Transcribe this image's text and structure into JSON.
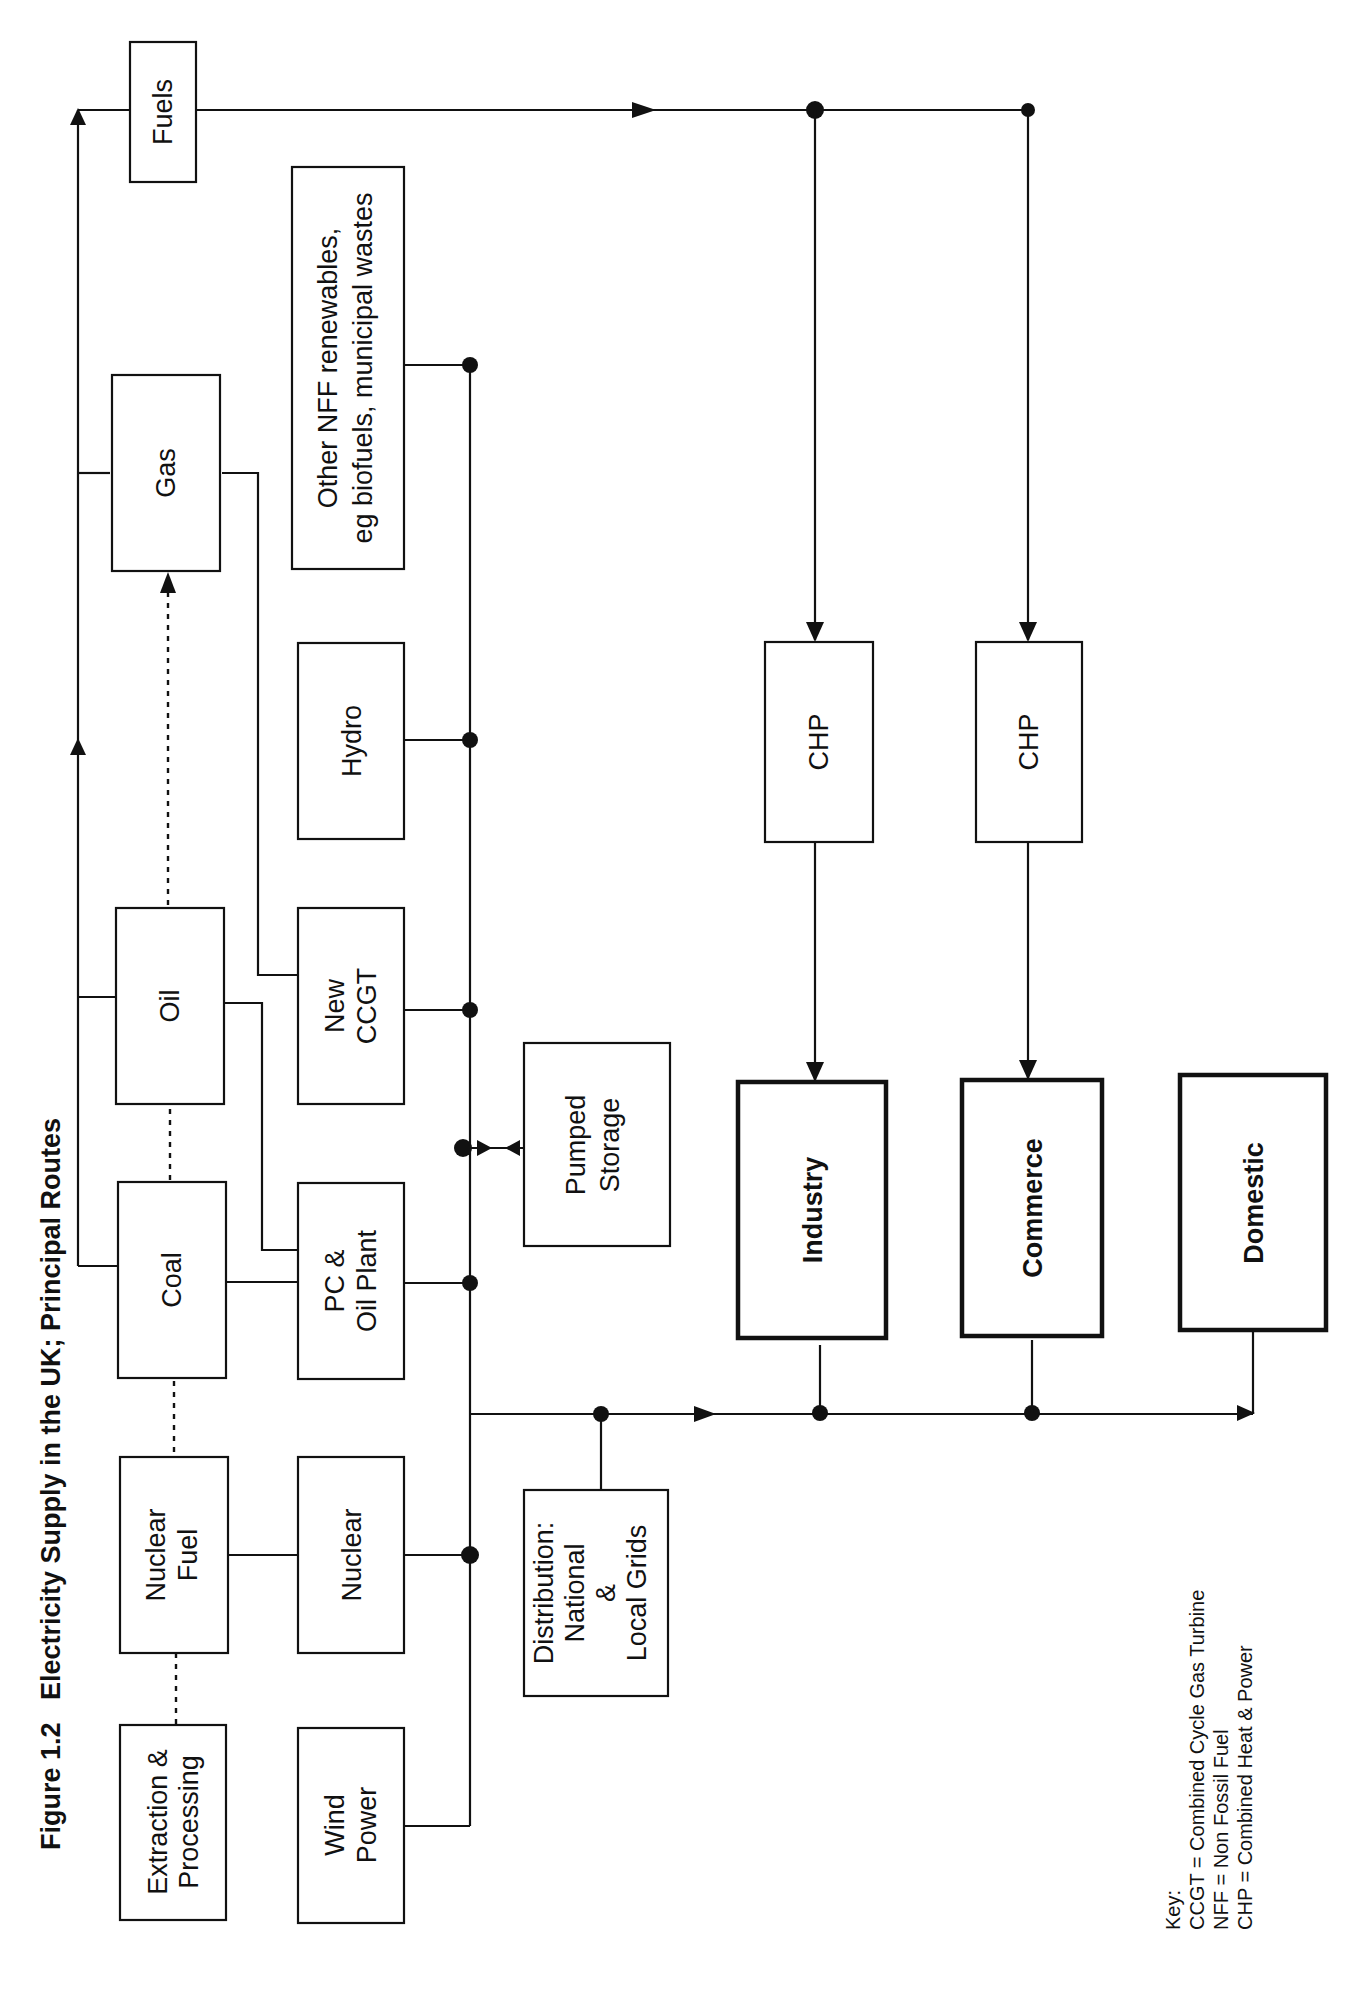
{
  "figure": {
    "number": "Figure 1.2",
    "title": "Electricity Supply in the UK; Principal Routes"
  },
  "nodes": {
    "extraction": [
      "Extraction &",
      "Processing"
    ],
    "nuclear_fuel": [
      "Nuclear",
      "Fuel"
    ],
    "coal": "Coal",
    "oil": "Oil",
    "gas": "Gas",
    "fuels": "Fuels",
    "wind": [
      "Wind",
      "Power"
    ],
    "nuclear": "Nuclear",
    "pc_oil": [
      "PC &",
      "Oil Plant"
    ],
    "new_ccgt": [
      "New",
      "CCGT"
    ],
    "hydro": "Hydro",
    "other_nff": [
      "Other NFF renewables,",
      "eg biofuels, municipal wastes"
    ],
    "pumped_storage": [
      "Pumped",
      "Storage"
    ],
    "distribution": [
      "Distribution:",
      "National",
      "&",
      "Local Grids"
    ],
    "chp_1": "CHP",
    "chp_2": "CHP",
    "industry": "Industry",
    "commerce": "Commerce",
    "domestic": "Domestic"
  },
  "key": {
    "heading": "Key:",
    "items": [
      "CCGT = Combined Cycle Gas  Turbine",
      "NFF = Non Fossil Fuel",
      "CHP = Combined Heat & Power"
    ]
  },
  "colors": {
    "ink": "#111111",
    "paper": "#ffffff"
  }
}
